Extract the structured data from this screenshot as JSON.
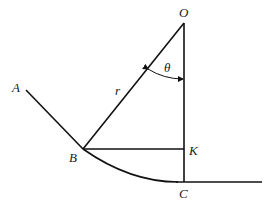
{
  "diagram": {
    "labels": {
      "O": "O",
      "A": "A",
      "B": "B",
      "K": "K",
      "C": "C",
      "r": "r",
      "theta": "θ"
    },
    "colors": {
      "stroke": "#111111",
      "background": "#ffffff"
    }
  }
}
